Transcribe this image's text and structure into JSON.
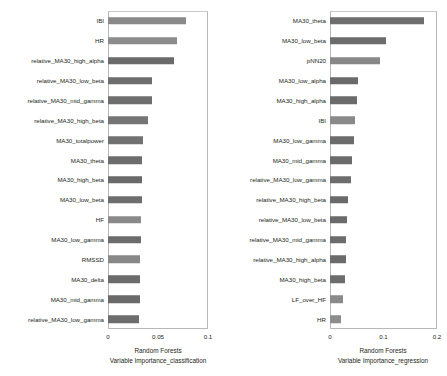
{
  "chart_data": [
    {
      "type": "bar",
      "orientation": "horizontal",
      "panel": "left",
      "title": "",
      "xlabel": "Random Forests\nVariable Importance_classification",
      "xlabel_line1": "Random Forests",
      "xlabel_line2": "Variable Importance_classification",
      "ylabel": "",
      "xlim": [
        0,
        0.1
      ],
      "xticks": [
        0,
        0.05,
        0.1
      ],
      "xtick_labels": [
        "0",
        "0.05",
        "0.1"
      ],
      "grid": false,
      "legend": "none",
      "categories": [
        "IBI",
        "HR",
        "relative_MA30_high_alpha",
        "relative_MA30_low_beta",
        "relative_MA30_mid_gamma",
        "relative_MA30_high_beta",
        "MA30_totalpower",
        "MA30_theta",
        "MA30_high_beta",
        "MA30_low_beta",
        "HF",
        "MA30_low_gamma",
        "RMSSD",
        "MA30_delta",
        "MA30_mid_gamma",
        "relative_MA30_low_gamma"
      ],
      "values": [
        0.0775,
        0.0685,
        0.066,
        0.044,
        0.044,
        0.04,
        0.0345,
        0.034,
        0.034,
        0.0335,
        0.033,
        0.0325,
        0.032,
        0.032,
        0.0315,
        0.031
      ],
      "bar_colors": [
        "#8a8a8a",
        "#8c8c8c",
        "#6b6b6b",
        "#6e6e6e",
        "#6e6e6e",
        "#757575",
        "#717171",
        "#6d6d6d",
        "#6a6a6a",
        "#6e6e6e",
        "#8a8a8a",
        "#6c6c6c",
        "#888888",
        "#6b6b6b",
        "#6a6a6a",
        "#6d6d6d"
      ]
    },
    {
      "type": "bar",
      "orientation": "horizontal",
      "panel": "right",
      "title": "",
      "xlabel": "Random Forests\nVariable Importance_regression",
      "xlabel_line1": "Random Forests",
      "xlabel_line2": "Variable Importance_regression",
      "ylabel": "",
      "xlim": [
        0,
        0.2
      ],
      "xticks": [
        0,
        0.1,
        0.2
      ],
      "xtick_labels": [
        "0",
        "0.1",
        "0.2"
      ],
      "grid": false,
      "legend": "none",
      "categories": [
        "MA30_theta",
        "MA30_low_beta",
        "pNN20",
        "MA30_low_alpha",
        "MA30_high_alpha",
        "IBI",
        "MA30_low_gamma",
        "MA30_mid_gamma",
        "relative_MA30_low_gamma",
        "relative_MA30_high_beta",
        "relative_MA30_low_beta",
        "relative_MA30_mid_gamma",
        "relative_MA30_high_alpha",
        "MA30_high_beta",
        "LF_over_HF",
        "HR"
      ],
      "values": [
        0.1755,
        0.105,
        0.094,
        0.052,
        0.05,
        0.046,
        0.0445,
        0.0415,
        0.04,
        0.034,
        0.0325,
        0.0305,
        0.03,
        0.0275,
        0.024,
        0.021
      ],
      "bar_colors": [
        "#6e6e6e",
        "#6c6c6c",
        "#888888",
        "#6a6a6a",
        "#6b6b6b",
        "#8a8a8a",
        "#6c6c6c",
        "#6b6b6b",
        "#6d6d6d",
        "#6a6a6a",
        "#6b6b6b",
        "#6c6c6c",
        "#6b6b6b",
        "#6d6d6d",
        "#8a8a8a",
        "#8c8c8c"
      ]
    }
  ]
}
